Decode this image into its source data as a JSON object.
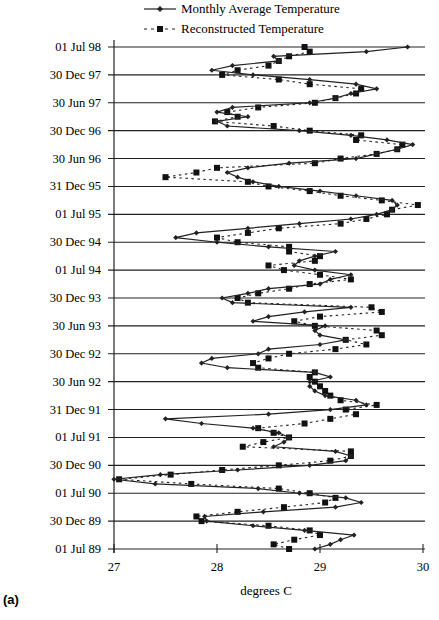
{
  "chart_data": {
    "type": "line",
    "orientation": "horizontal-time-vertical",
    "title": "",
    "panel_label": "(a)",
    "xlabel": "degrees C",
    "ylabel": "",
    "xlim": [
      27,
      30
    ],
    "x_ticks": [
      "27",
      "28",
      "29",
      "30"
    ],
    "y_tick_labels": [
      "01 Jul 98",
      "30 Dec 97",
      "30 Jun 97",
      "30 Dec 96",
      "30 Jun 96",
      "31 Dec 95",
      "01 Jul 95",
      "30 Dec 94",
      "01 Jul 94",
      "30 Dec 93",
      "30 Jun 93",
      "30 Dec 92",
      "30 Jun 92",
      "31 Dec 91",
      "01 Jul 91",
      "30 Dec 90",
      "01 Jul 90",
      "30 Dec 89",
      "01 Jul 89"
    ],
    "grid": "horizontal gridlines at each 6-month tick",
    "legend": {
      "position": "top",
      "entries": [
        {
          "label": "Monthly Average Temperature",
          "style": "solid line, diamond markers"
        },
        {
          "label": "Reconstructed Temperature",
          "style": "dashed line, square markers"
        }
      ]
    },
    "time_axis": "monthly from Jul 1989 (bottom) to Jul 1998 (top)",
    "series": [
      {
        "name": "Monthly Average Temperature",
        "values": [
          28.95,
          29.1,
          29.2,
          29.33,
          28.85,
          28.35,
          27.9,
          27.88,
          28.45,
          29.15,
          29.4,
          29.25,
          28.8,
          28.4,
          27.4,
          27.0,
          27.45,
          28.2,
          28.9,
          29.25,
          29.3,
          29.15,
          28.55,
          28.65,
          28.7,
          28.6,
          28.35,
          27.85,
          27.5,
          28.5,
          29.1,
          29.45,
          29.35,
          29.05,
          28.95,
          28.9,
          28.9,
          29.1,
          28.95,
          28.1,
          27.85,
          27.95,
          28.4,
          28.5,
          29.0,
          29.25,
          29.0,
          28.95,
          29.05,
          28.35,
          28.5,
          28.85,
          29.3,
          28.15,
          28.05,
          28.3,
          28.5,
          29.0,
          29.1,
          29.3,
          28.95,
          28.75,
          28.8,
          28.95,
          29.15,
          28.5,
          28.0,
          27.6,
          27.8,
          28.3,
          28.8,
          29.3,
          29.55,
          29.7,
          29.75,
          29.7,
          29.35,
          29.0,
          28.6,
          28.35,
          28.2,
          28.1,
          28.3,
          28.7,
          29.35,
          29.55,
          29.75,
          29.9,
          29.65,
          29.3,
          28.8,
          28.1,
          28.0,
          28.3,
          28.0,
          28.15,
          28.9,
          29.15,
          29.3,
          29.55,
          29.35,
          28.9,
          28.35,
          27.95,
          28.15,
          28.6,
          28.55,
          29.45,
          29.85
        ]
      },
      {
        "name": "Reconstructed Temperature",
        "values": [
          28.7,
          28.55,
          28.75,
          29.0,
          28.9,
          28.5,
          27.85,
          27.8,
          28.2,
          28.65,
          29.05,
          29.15,
          28.9,
          28.6,
          27.75,
          27.05,
          27.55,
          28.05,
          28.6,
          29.1,
          29.3,
          29.3,
          28.25,
          28.45,
          28.7,
          28.55,
          28.4,
          28.85,
          29.1,
          29.35,
          29.25,
          29.55,
          29.2,
          29.1,
          29.05,
          29.0,
          28.95,
          28.9,
          28.95,
          28.4,
          28.35,
          28.5,
          28.7,
          29.15,
          29.45,
          29.25,
          29.6,
          29.55,
          28.95,
          28.75,
          29.0,
          29.6,
          29.5,
          28.3,
          28.2,
          28.4,
          28.7,
          28.9,
          29.3,
          29.0,
          28.65,
          28.5,
          28.95,
          29.0,
          28.7,
          28.7,
          28.2,
          28.0,
          28.3,
          28.6,
          29.2,
          29.45,
          29.65,
          29.7,
          29.95,
          29.6,
          29.2,
          28.9,
          28.5,
          28.3,
          27.5,
          27.8,
          28.0,
          28.95,
          29.2,
          29.55,
          29.75,
          29.8,
          29.35,
          29.4,
          28.9,
          28.55,
          27.98,
          28.2,
          28.1,
          28.4,
          28.95,
          29.15,
          29.35,
          29.4,
          28.9,
          28.6,
          28.05,
          28.2,
          28.5,
          28.6,
          28.7,
          28.9,
          28.85
        ]
      }
    ]
  },
  "legend": {
    "line1": "Monthly Average Temperature",
    "line2": "Reconstructed Temperature"
  },
  "axis": {
    "xlabel": "degrees C",
    "panel_label": "(a)"
  }
}
